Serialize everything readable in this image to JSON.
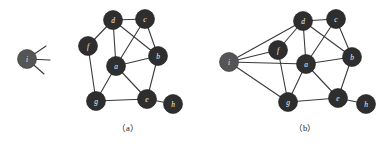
{
  "figure": {
    "width": 384,
    "height": 144,
    "background_color": "#ffffff",
    "node_fill_color": "#2e2e2e",
    "node_isolated_fill_color": "#555555",
    "node_label_color": "#f2f2f2",
    "edge_color": "#3a3a3a",
    "caption_color": "#1a1a1a"
  },
  "panels": [
    {
      "id": "panel-a",
      "caption": "（a）",
      "caption_x": 128,
      "caption_y": 128,
      "nodes": [
        {
          "id": "i",
          "label": "i",
          "x": 27,
          "y": 59,
          "r": 9.5,
          "isolated": true
        },
        {
          "id": "f",
          "label": "f",
          "x": 88,
          "y": 46,
          "r": 9.5,
          "isolated": false
        },
        {
          "id": "d",
          "label": "d",
          "x": 113,
          "y": 20,
          "r": 9.5,
          "isolated": false
        },
        {
          "id": "c",
          "label": "c",
          "x": 145,
          "y": 19,
          "r": 9.5,
          "isolated": false
        },
        {
          "id": "b",
          "label": "b",
          "x": 158,
          "y": 56,
          "r": 9.5,
          "isolated": false
        },
        {
          "id": "a",
          "label": "a",
          "x": 116,
          "y": 66,
          "r": 9.5,
          "isolated": false
        },
        {
          "id": "g",
          "label": "g",
          "x": 96,
          "y": 101,
          "r": 9.5,
          "isolated": false
        },
        {
          "id": "e",
          "label": "e",
          "x": 147,
          "y": 99,
          "r": 9.5,
          "isolated": false
        },
        {
          "id": "h",
          "label": "h",
          "x": 173,
          "y": 104,
          "r": 9.5,
          "isolated": false
        }
      ],
      "edges": [
        [
          "f",
          "d"
        ],
        [
          "f",
          "g"
        ],
        [
          "d",
          "a"
        ],
        [
          "d",
          "b"
        ],
        [
          "d",
          "c"
        ],
        [
          "c",
          "a"
        ],
        [
          "c",
          "b"
        ],
        [
          "a",
          "b"
        ],
        [
          "a",
          "g"
        ],
        [
          "a",
          "e"
        ],
        [
          "b",
          "e"
        ],
        [
          "g",
          "e"
        ],
        [
          "e",
          "h"
        ]
      ],
      "stubs": [
        {
          "from": "i",
          "dx": 19,
          "dy": -13
        },
        {
          "from": "i",
          "dx": 23,
          "dy": 1
        },
        {
          "from": "i",
          "dx": 17,
          "dy": 15
        }
      ]
    },
    {
      "id": "panel-b",
      "caption": "（b）",
      "caption_x": 305,
      "caption_y": 128,
      "nodes": [
        {
          "id": "i",
          "label": "i",
          "x": 229,
          "y": 62,
          "r": 9.5,
          "isolated": true
        },
        {
          "id": "f",
          "label": "f",
          "x": 278,
          "y": 50,
          "r": 9.5,
          "isolated": false
        },
        {
          "id": "d",
          "label": "d",
          "x": 303,
          "y": 21,
          "r": 9.5,
          "isolated": false
        },
        {
          "id": "c",
          "label": "c",
          "x": 336,
          "y": 19,
          "r": 9.5,
          "isolated": false
        },
        {
          "id": "b",
          "label": "b",
          "x": 352,
          "y": 57,
          "r": 9.5,
          "isolated": false
        },
        {
          "id": "a",
          "label": "a",
          "x": 306,
          "y": 64,
          "r": 9.5,
          "isolated": false
        },
        {
          "id": "g",
          "label": "g",
          "x": 288,
          "y": 102,
          "r": 9.5,
          "isolated": false
        },
        {
          "id": "e",
          "label": "e",
          "x": 338,
          "y": 98,
          "r": 9.5,
          "isolated": false
        },
        {
          "id": "h",
          "label": "h",
          "x": 366,
          "y": 104,
          "r": 9.5,
          "isolated": false
        }
      ],
      "edges": [
        [
          "i",
          "d"
        ],
        [
          "i",
          "f"
        ],
        [
          "i",
          "a"
        ],
        [
          "i",
          "g"
        ],
        [
          "f",
          "d"
        ],
        [
          "f",
          "g"
        ],
        [
          "d",
          "a"
        ],
        [
          "d",
          "b"
        ],
        [
          "d",
          "c"
        ],
        [
          "c",
          "a"
        ],
        [
          "c",
          "b"
        ],
        [
          "a",
          "b"
        ],
        [
          "a",
          "g"
        ],
        [
          "a",
          "e"
        ],
        [
          "b",
          "e"
        ],
        [
          "g",
          "e"
        ],
        [
          "e",
          "h"
        ]
      ],
      "stubs": []
    }
  ]
}
